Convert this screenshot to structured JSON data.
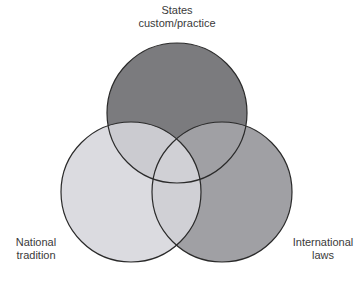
{
  "diagram": {
    "type": "venn",
    "sets": [
      {
        "id": "top",
        "label_lines": [
          "States",
          "custom/practice"
        ],
        "fill": "#7b7b7e",
        "cx": 177,
        "cy": 113,
        "r": 70
      },
      {
        "id": "left",
        "label_lines": [
          "National",
          "tradition"
        ],
        "fill": "#d6d6dc",
        "cx": 131,
        "cy": 192,
        "r": 70
      },
      {
        "id": "right",
        "label_lines": [
          "International",
          "laws"
        ],
        "fill": "#a0a0a4",
        "cx": 222,
        "cy": 192,
        "r": 70
      }
    ],
    "stroke": "#2a2a2a",
    "overlaps": {
      "top_left": "#cbcbd0",
      "top_right": "#a0a0a4",
      "left_right": "#cacace"
    }
  }
}
